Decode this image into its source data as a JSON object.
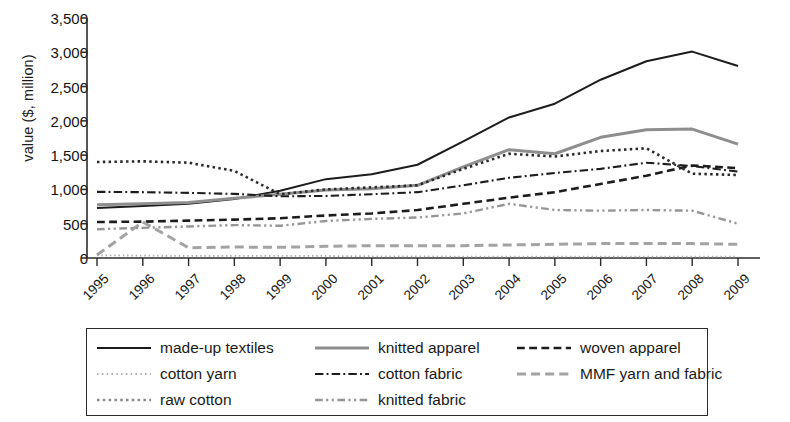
{
  "chart_data": {
    "type": "line",
    "title": "",
    "xlabel": "",
    "ylabel": "value ($, million)",
    "ylim": [
      0,
      3500
    ],
    "ytick_labels": [
      "0",
      "500",
      "1,000",
      "1,500",
      "2,000",
      "2,500",
      "3,000",
      "3,500"
    ],
    "ytick_values": [
      0,
      500,
      1000,
      1500,
      2000,
      2500,
      3000,
      3500
    ],
    "grid": false,
    "legend_position": "below",
    "x": [
      1995,
      1996,
      1997,
      1998,
      1999,
      2000,
      2001,
      2002,
      2003,
      2004,
      2005,
      2006,
      2007,
      2008,
      2009
    ],
    "categories": [
      "1995",
      "1996",
      "1997",
      "1998",
      "1999",
      "2000",
      "2001",
      "2002",
      "2003",
      "2004",
      "2005",
      "2006",
      "2007",
      "2008",
      "2009"
    ],
    "series": [
      {
        "name": "made-up textiles",
        "style": "solid",
        "color": "#1c1c1c",
        "width": 2.0,
        "values": [
          730,
          760,
          790,
          860,
          980,
          1150,
          1220,
          1360,
          1700,
          2050,
          2250,
          2600,
          2870,
          3010,
          2800
        ]
      },
      {
        "name": "knitted apparel",
        "style": "solid",
        "color": "#8e8e8e",
        "width": 3.0,
        "values": [
          775,
          790,
          810,
          870,
          930,
          990,
          1010,
          1060,
          1330,
          1580,
          1520,
          1760,
          1870,
          1880,
          1660
        ]
      },
      {
        "name": "woven apparel",
        "style": "dashed",
        "color": "#1c1c1c",
        "width": 2.6,
        "values": [
          525,
          530,
          545,
          560,
          580,
          620,
          650,
          700,
          790,
          880,
          960,
          1080,
          1200,
          1350,
          1310
        ]
      },
      {
        "name": "cotton yarn",
        "style": "fine-dotted",
        "color": "#aaaaaa",
        "width": 1.8,
        "values": [
          40,
          35,
          30,
          30,
          30,
          30,
          25,
          25,
          20,
          20,
          20,
          20,
          20,
          20,
          20
        ]
      },
      {
        "name": "cotton fabric",
        "style": "dashdot",
        "color": "#1c1c1c",
        "width": 2.1,
        "values": [
          965,
          960,
          950,
          935,
          900,
          905,
          930,
          960,
          1060,
          1170,
          1240,
          1300,
          1390,
          1340,
          1260
        ]
      },
      {
        "name": "MMF yarn and fabric",
        "style": "dashed",
        "color": "#a3a3a3",
        "width": 3.0,
        "values": [
          45,
          525,
          150,
          160,
          155,
          170,
          180,
          180,
          180,
          190,
          200,
          210,
          210,
          210,
          200
        ]
      },
      {
        "name": "raw cotton",
        "style": "dotted",
        "color": "#2b2b2b",
        "width": 2.6,
        "values": [
          1400,
          1410,
          1390,
          1270,
          930,
          1000,
          1030,
          1060,
          1300,
          1520,
          1480,
          1560,
          1600,
          1230,
          1210
        ]
      },
      {
        "name": "knitted fabric",
        "style": "dashdotdot",
        "color": "#969696",
        "width": 2.4,
        "values": [
          420,
          440,
          460,
          480,
          470,
          540,
          570,
          590,
          650,
          790,
          700,
          690,
          700,
          690,
          500
        ]
      }
    ],
    "secondary_low_series_note": ""
  },
  "axis": {
    "y_label": "value ($, million)"
  },
  "legend": {
    "columns": [
      [
        {
          "label": "made-up textiles",
          "style": "solid",
          "color": "#1c1c1c",
          "width": 2.0
        },
        {
          "label": "cotton yarn",
          "style": "fine-dotted",
          "color": "#b0b0b0",
          "width": 2.0
        },
        {
          "label": "raw cotton",
          "style": "dotted",
          "color": "#8a8a8a",
          "width": 2.6
        }
      ],
      [
        {
          "label": "knitted apparel",
          "style": "solid",
          "color": "#8e8e8e",
          "width": 3.0
        },
        {
          "label": "cotton fabric",
          "style": "dashdot",
          "color": "#1c1c1c",
          "width": 2.1
        },
        {
          "label": "knitted fabric",
          "style": "dashdotdot",
          "color": "#969696",
          "width": 2.4
        }
      ],
      [
        {
          "label": "woven apparel",
          "style": "dashed",
          "color": "#1c1c1c",
          "width": 2.6
        },
        {
          "label": "MMF yarn and fabric",
          "style": "dashed",
          "color": "#a3a3a3",
          "width": 3.0
        }
      ]
    ]
  }
}
